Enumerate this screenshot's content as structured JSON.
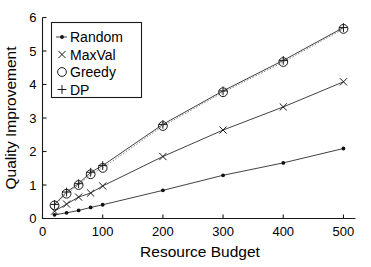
{
  "chart_data": {
    "type": "line",
    "title": "",
    "xlabel": "Resource Budget",
    "ylabel": "Quality Improvement",
    "xlim": [
      0,
      520
    ],
    "ylim": [
      0,
      6
    ],
    "xticks": [
      0,
      100,
      200,
      300,
      400,
      500
    ],
    "xtick_labels": [
      "0",
      "100",
      "200",
      "300",
      "400",
      "500"
    ],
    "yticks": [
      0,
      1,
      2,
      3,
      4,
      5,
      6
    ],
    "ytick_labels": [
      "0",
      "1",
      "2",
      "3",
      "4",
      "5",
      "6"
    ],
    "grid": false,
    "legend_position": "upper left",
    "x": [
      20,
      40,
      60,
      80,
      100,
      200,
      300,
      400,
      500
    ],
    "series": [
      {
        "name": "Random",
        "marker": "dot",
        "linestyle": "solid",
        "values": [
          0.11,
          0.17,
          0.24,
          0.33,
          0.41,
          0.84,
          1.29,
          1.66,
          2.09
        ]
      },
      {
        "name": "MaxVal",
        "marker": "x",
        "linestyle": "solid",
        "values": [
          0.22,
          0.43,
          0.64,
          0.76,
          0.97,
          1.85,
          2.64,
          3.33,
          4.08
        ]
      },
      {
        "name": "Greedy",
        "marker": "circle",
        "linestyle": "dotted",
        "values": [
          0.39,
          0.74,
          1.0,
          1.32,
          1.51,
          2.76,
          3.77,
          4.67,
          5.66
        ]
      },
      {
        "name": "DP",
        "marker": "plus",
        "linestyle": "solid",
        "values": [
          0.42,
          0.79,
          1.04,
          1.38,
          1.58,
          2.81,
          3.81,
          4.72,
          5.7
        ]
      }
    ]
  },
  "legend": {
    "entries": [
      {
        "label": "Random",
        "marker": "dot-line-marker"
      },
      {
        "label": "MaxVal",
        "marker": "x-marker"
      },
      {
        "label": "Greedy",
        "marker": "circle-marker"
      },
      {
        "label": "DP",
        "marker": "plus-marker"
      }
    ]
  }
}
